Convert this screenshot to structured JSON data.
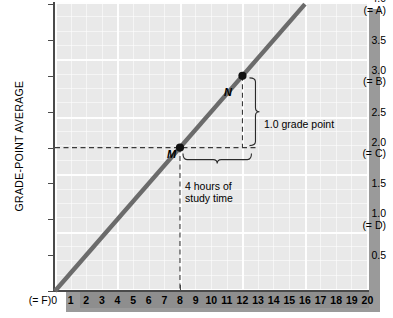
{
  "chart_data": {
    "type": "line",
    "title": "",
    "xlabel": "",
    "ylabel": "GRADE-POINT AVERAGE",
    "xlim": [
      0,
      20
    ],
    "ylim": [
      0,
      4.0
    ],
    "grid": true,
    "legend": "none",
    "x": [
      0,
      16
    ],
    "values": [
      0.0,
      4.0
    ],
    "series": [
      {
        "name": "grade-point average vs. study time",
        "x": [
          0,
          16
        ],
        "values": [
          0.0,
          4.0
        ],
        "color": "#6b6b6b",
        "slope": 0.25,
        "intercept": 0.0
      }
    ],
    "points": [
      {
        "label": "M",
        "x": 8,
        "y": 2.0
      },
      {
        "label": "N",
        "x": 12,
        "y": 3.0
      }
    ],
    "annotations": [
      {
        "name": "rise-brace",
        "text": "1.0 grade point",
        "value": 1.0,
        "unit": "grade point"
      },
      {
        "name": "run-brace",
        "text": "4 hours of\nstudy time",
        "line1": "4 hours of",
        "line2": "study time",
        "value": 4,
        "unit": "hours"
      }
    ],
    "y_ticks": [
      {
        "value": "4.0",
        "grade": "(= A)"
      },
      {
        "value": "3.5",
        "grade": ""
      },
      {
        "value": "3.0",
        "grade": "(= B)"
      },
      {
        "value": "2.5",
        "grade": ""
      },
      {
        "value": "2.0",
        "grade": "(= C)"
      },
      {
        "value": "1.5",
        "grade": ""
      },
      {
        "value": "1.0",
        "grade": "(= D)"
      },
      {
        "value": "0.5",
        "grade": ""
      },
      {
        "value": "0",
        "grade": "(= F)"
      }
    ],
    "x_ticks": [
      "0",
      "1",
      "2",
      "3",
      "4",
      "5",
      "6",
      "7",
      "8",
      "9",
      "10",
      "11",
      "12",
      "13",
      "14",
      "15",
      "16",
      "17",
      "18",
      "19",
      "20"
    ],
    "x_zero_label": "(= F)0",
    "colors": {
      "plot_background": "#e9e9e9",
      "gridline": "#ffffff",
      "axis": "#4a4a4a",
      "data_line": "#6b6b6b",
      "x_band": "#8e8e8e",
      "shadow": "#9a9a9a",
      "dashed_guide": "#3a3a3a"
    }
  },
  "labels": {
    "y_axis_title": "GRADE-POINT AVERAGE",
    "point_M": "M",
    "point_N": "N",
    "grade_point_text": "1.0 grade point",
    "hours_line1": "4 hours of",
    "hours_line2": "study time",
    "x_zero": "(= F)0"
  },
  "y_ticks": [
    {
      "value": "4.0",
      "grade": "(= A)"
    },
    {
      "value": "3.5",
      "grade": ""
    },
    {
      "value": "3.0",
      "grade": "(= B)"
    },
    {
      "value": "2.5",
      "grade": ""
    },
    {
      "value": "2.0",
      "grade": "(= C)"
    },
    {
      "value": "1.5",
      "grade": ""
    },
    {
      "value": "1.0",
      "grade": "(= D)"
    },
    {
      "value": "0.5",
      "grade": ""
    },
    {
      "value": "0",
      "grade": "(= F)"
    }
  ],
  "x_ticks": [
    "1",
    "2",
    "3",
    "4",
    "5",
    "6",
    "7",
    "8",
    "9",
    "10",
    "11",
    "12",
    "13",
    "14",
    "15",
    "16",
    "17",
    "18",
    "19",
    "20"
  ]
}
